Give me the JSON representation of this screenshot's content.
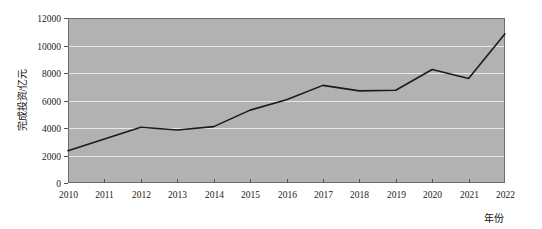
{
  "chart_data": {
    "type": "line",
    "title": "",
    "subtitle": "",
    "xlabel": "年份",
    "ylabel": "完成投资/亿元",
    "categories": [
      "2010",
      "2011",
      "2012",
      "2013",
      "2014",
      "2015",
      "2016",
      "2017",
      "2018",
      "2019",
      "2020",
      "2021",
      "2022"
    ],
    "x": [
      2010,
      2011,
      2012,
      2013,
      2014,
      2015,
      2016,
      2017,
      2018,
      2019,
      2020,
      2021,
      2022
    ],
    "values": [
      2350,
      3200,
      4050,
      3850,
      4100,
      5300,
      6050,
      7100,
      6700,
      6750,
      8250,
      7600,
      10850
    ],
    "series": [
      {
        "name": "完成投资",
        "values": [
          2350,
          3200,
          4050,
          3850,
          4100,
          5300,
          6050,
          7100,
          6700,
          6750,
          8250,
          7600,
          10850
        ]
      }
    ],
    "ylim": [
      0,
      12000
    ],
    "yticks": [
      0,
      2000,
      4000,
      6000,
      8000,
      10000,
      12000
    ],
    "ytick_labels": [
      "0",
      "2000",
      "4000",
      "6000",
      "8000",
      "10000",
      "12000"
    ],
    "xtick_labels": [
      "2010",
      "2011",
      "2012",
      "2013",
      "2014",
      "2015",
      "2016",
      "2017",
      "2018",
      "2019",
      "2020",
      "2021",
      "2022"
    ],
    "grid": true,
    "grid_axis": "y",
    "legend": false,
    "legend_position": "none",
    "colors": {
      "line": "#1b1b1b",
      "plot_background": "#b2b2b2",
      "gridline": "#e8e8e8",
      "axis": "#555555",
      "text": "#1a1a1a",
      "page_background": "#ffffff"
    },
    "annotations": []
  },
  "layout": {
    "plot": {
      "left": 68,
      "top": 18,
      "right": 505,
      "bottom": 183
    }
  }
}
